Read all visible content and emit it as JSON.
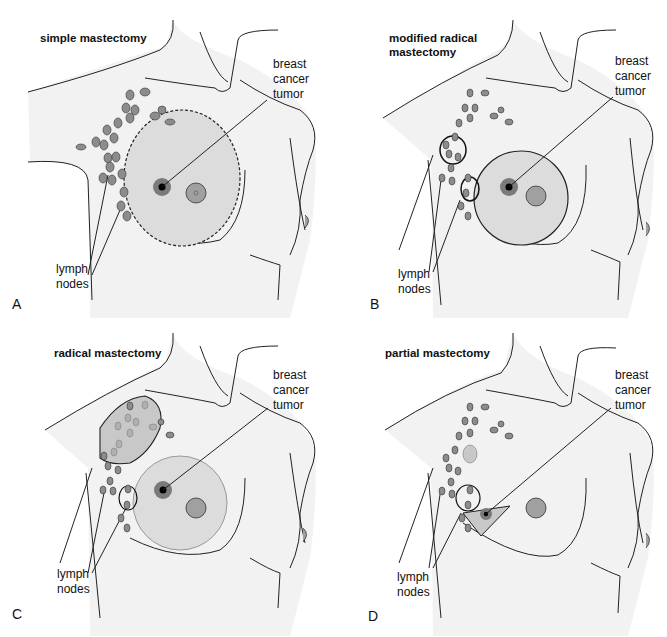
{
  "colors": {
    "body_fill": "#f2f2f2",
    "excision_fill": "#dcdcdc",
    "node_fill": "#8c8c8c",
    "tumor_ring": "#7a7a7a",
    "tumor_core": "#000000",
    "nipple_fill": "#a0a0a0",
    "outline": "#222222"
  },
  "panels": [
    {
      "letter": "A",
      "title": "simple mastectomy",
      "tumor_label": [
        "breast",
        "cancer",
        "tumor"
      ],
      "lymph_label": [
        "lymph",
        "nodes"
      ]
    },
    {
      "letter": "B",
      "title": "modified radical mastectomy",
      "title_lines": [
        "modified radical",
        "mastectomy"
      ],
      "tumor_label": [
        "breast",
        "cancer",
        "tumor"
      ],
      "lymph_label": [
        "lymph",
        "nodes"
      ]
    },
    {
      "letter": "C",
      "title": "radical mastectomy",
      "tumor_label": [
        "breast",
        "cancer",
        "tumor"
      ],
      "lymph_label": [
        "lymph",
        "nodes"
      ]
    },
    {
      "letter": "D",
      "title": "partial mastectomy",
      "tumor_label": [
        "breast",
        "cancer",
        "tumor"
      ],
      "lymph_label": [
        "lymph",
        "nodes"
      ]
    }
  ]
}
